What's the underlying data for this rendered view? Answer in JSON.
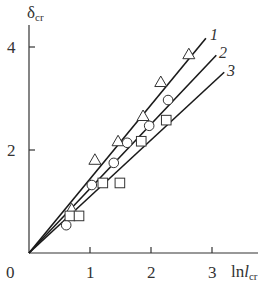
{
  "chart_data": {
    "type": "scatter",
    "title": "",
    "xlabel": "ln l_cr",
    "ylabel": "δ_cr",
    "xlim": [
      0,
      3.6
    ],
    "ylim": [
      0,
      4.4
    ],
    "x_ticks": [
      1,
      2,
      3
    ],
    "y_ticks": [
      2,
      4
    ],
    "x_tick_labels": [
      "0",
      "1",
      "2",
      "3"
    ],
    "y_tick_labels": [
      "2",
      "4"
    ],
    "grid": false,
    "legend": "inline line labels 1, 2, 3 at line ends",
    "series": [
      {
        "name": "1",
        "marker": "triangle",
        "points": [
          [
            0.7,
            0.85
          ],
          [
            1.08,
            1.81
          ],
          [
            1.46,
            2.17
          ],
          [
            1.87,
            2.66
          ],
          [
            2.16,
            3.32
          ],
          [
            2.62,
            3.86
          ]
        ],
        "fit_line": [
          [
            0,
            0
          ],
          [
            2.9,
            4.17
          ]
        ]
      },
      {
        "name": "2",
        "marker": "circle",
        "points": [
          [
            0.61,
            0.54
          ],
          [
            1.03,
            1.32
          ],
          [
            1.39,
            1.75
          ],
          [
            1.61,
            2.14
          ],
          [
            1.97,
            2.47
          ],
          [
            2.28,
            2.97
          ]
        ],
        "fit_line": [
          [
            0,
            0
          ],
          [
            3.07,
            3.84
          ]
        ]
      },
      {
        "name": "3",
        "marker": "square",
        "points": [
          [
            0.67,
            0.72
          ],
          [
            0.82,
            0.72
          ],
          [
            1.21,
            1.36
          ],
          [
            1.49,
            1.36
          ],
          [
            1.84,
            2.17
          ],
          [
            2.25,
            2.58
          ]
        ],
        "fit_line": [
          [
            0,
            0
          ],
          [
            3.2,
            3.51
          ]
        ]
      }
    ]
  },
  "labels": {
    "y_axis_main": "δ",
    "y_axis_sub": "cr",
    "x_axis_main": "ln",
    "x_axis_var": "l",
    "x_axis_sub": "cr",
    "origin": "0",
    "x1": "1",
    "x2": "2",
    "x3": "3",
    "y2": "2",
    "y4": "4",
    "line1": "1",
    "line2": "2",
    "line3": "3"
  }
}
